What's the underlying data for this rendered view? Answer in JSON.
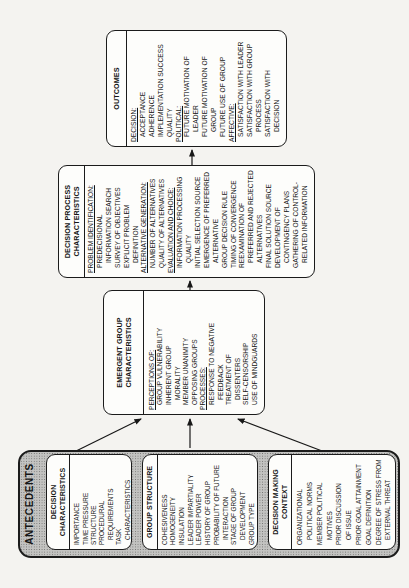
{
  "figure": {
    "antecedents": {
      "title": "ANTECEDENTS",
      "boxes": [
        {
          "title_lines": [
            "DECISION",
            "CHARACTERISTICS"
          ],
          "lines": [
            {
              "text": "IMPORTANCE",
              "indent": 0
            },
            {
              "text": "TIME PRESSURE",
              "indent": 0
            },
            {
              "text": "STRUCTURE",
              "indent": 0
            },
            {
              "text": "PROCEDURAL",
              "indent": 0
            },
            {
              "text": "REQUIREMENTS",
              "indent": 1
            },
            {
              "text": "TASK",
              "indent": 0
            },
            {
              "text": "CHARACTERISTICS",
              "indent": 1
            }
          ]
        },
        {
          "title_lines": [
            "GROUP STRUCTURE"
          ],
          "lines": [
            {
              "text": "COHESIVENESS",
              "indent": 0
            },
            {
              "text": "HOMOGENEITY",
              "indent": 0
            },
            {
              "text": "INSULATION",
              "indent": 0
            },
            {
              "text": "LEADER IMPARTIALITY",
              "indent": 0
            },
            {
              "text": "LEADER POWER",
              "indent": 0
            },
            {
              "text": "HISTORY OF GROUP",
              "indent": 0
            },
            {
              "text": "PROBABILITY OF FUTURE",
              "indent": 0
            },
            {
              "text": "INTERACTION",
              "indent": 1
            },
            {
              "text": "STAGE OF GROUP",
              "indent": 0
            },
            {
              "text": "DEVELOPMENT",
              "indent": 1
            },
            {
              "text": "GROUP TYPE",
              "indent": 0
            }
          ]
        },
        {
          "title_lines": [
            "DECISION MAKING",
            "CONTEXT"
          ],
          "lines": [
            {
              "text": "ORGANIZATIONAL",
              "indent": 0
            },
            {
              "text": "POLITICAL NORMS",
              "indent": 1
            },
            {
              "text": "MEMBER POLITICAL",
              "indent": 0
            },
            {
              "text": "MOTIVES",
              "indent": 1
            },
            {
              "text": "PRIOR DISCUSSION",
              "indent": 0
            },
            {
              "text": "OF ISSUE",
              "indent": 1
            },
            {
              "text": "PRIOR GOAL ATTAINMENT",
              "indent": 0
            },
            {
              "text": "GOAL DEFINITION",
              "indent": 0
            },
            {
              "text": "DEGREE OF STRESS FROM",
              "indent": 0
            },
            {
              "text": "EXTERNAL THREAT",
              "indent": 1
            }
          ]
        }
      ]
    },
    "emergent_group_characteristics": {
      "title_lines": [
        "EMERGENT GROUP",
        "CHARACTERISTICS"
      ],
      "lines": [
        {
          "text": "PERCEPTIONS OF:",
          "indent": 0,
          "underline": true
        },
        {
          "text": "GROUP VULNERABILITY",
          "indent": 1
        },
        {
          "text": "INHERENT GROUP",
          "indent": 1
        },
        {
          "text": "MORALITY",
          "indent": 2
        },
        {
          "text": "MEMBER UNANIMITY",
          "indent": 1
        },
        {
          "text": "OPPOSING GROUPS",
          "indent": 1
        },
        {
          "text": "PROCESSES:",
          "indent": 0,
          "underline": true
        },
        {
          "text": "RESPONSE TO NEGATIVE",
          "indent": 1
        },
        {
          "text": "FEEDBACK",
          "indent": 2
        },
        {
          "text": "TREATMENT OF",
          "indent": 1
        },
        {
          "text": "DISSENTERS",
          "indent": 2
        },
        {
          "text": "SELF-CENSORSHIP",
          "indent": 1
        },
        {
          "text": "USE OF MINDGUARDS",
          "indent": 1
        }
      ]
    },
    "decision_process_characteristics": {
      "title_lines": [
        "DECISION PROCESS",
        "CHARACTERISTICS"
      ],
      "lines": [
        {
          "text": "PROBLEM IDENTIFICATION:",
          "indent": 0,
          "underline": true
        },
        {
          "text": "PREDECISIONAL",
          "indent": 1
        },
        {
          "text": "INFORMATION SEARCH",
          "indent": 2
        },
        {
          "text": "SURVEY OF OBJECTIVES",
          "indent": 1
        },
        {
          "text": "EXPLICIT PROBLEM",
          "indent": 1
        },
        {
          "text": "DEFINITION",
          "indent": 2
        },
        {
          "text": "ALTERNATIVE GENERATION:",
          "indent": 0,
          "underline": true
        },
        {
          "text": "NUMBER OF ALTERNATIVES",
          "indent": 1
        },
        {
          "text": "QUALITY OF ALTERNATIVES",
          "indent": 1
        },
        {
          "text": "EVALUATION AND CHOICE:",
          "indent": 0,
          "underline": true
        },
        {
          "text": "INFORMATION PROCESSING",
          "indent": 1
        },
        {
          "text": "QUALITY",
          "indent": 2
        },
        {
          "text": "INITIAL SELECTION SOURCE",
          "indent": 1
        },
        {
          "text": "EMERGENCE OF PREFERRED",
          "indent": 1
        },
        {
          "text": "ALTERNATIVE",
          "indent": 2
        },
        {
          "text": "GROUP DECISION RULE",
          "indent": 1
        },
        {
          "text": "TIMING OF CONVERGENCE",
          "indent": 1
        },
        {
          "text": "REEXAMINATION OF",
          "indent": 1
        },
        {
          "text": "PREFERRED AND REJECTED",
          "indent": 2
        },
        {
          "text": "ALTERNATIVES",
          "indent": 2
        },
        {
          "text": "FINAL SOLUTION SOURCE",
          "indent": 1
        },
        {
          "text": "DEVELOPMENT OF",
          "indent": 1
        },
        {
          "text": "CONTINGENCY PLANS",
          "indent": 2
        },
        {
          "text": "GATHERING OF CONTROL-",
          "indent": 1
        },
        {
          "text": "RELATED INFORMATION",
          "indent": 2
        }
      ]
    },
    "outcomes": {
      "title_lines": [
        "OUTCOMES"
      ],
      "lines": [
        {
          "text": "DECISION:",
          "indent": 0,
          "underline": true
        },
        {
          "text": "ACCEPTANCE",
          "indent": 1
        },
        {
          "text": "ADHERENCE",
          "indent": 1
        },
        {
          "text": "IMPLEMENTATION SUCCESS",
          "indent": 1
        },
        {
          "text": "QUALITY",
          "indent": 1
        },
        {
          "text": "POLITICAL:",
          "indent": 0,
          "underline": true
        },
        {
          "text": "FUTURE MOTIVATION OF",
          "indent": 1
        },
        {
          "text": "LEADER",
          "indent": 2
        },
        {
          "text": "FUTURE MOTIVATION OF",
          "indent": 1
        },
        {
          "text": "GROUP",
          "indent": 2
        },
        {
          "text": "FUTURE USE OF GROUP",
          "indent": 1
        },
        {
          "text": "AFFECTIVE:",
          "indent": 0,
          "underline": true
        },
        {
          "text": "SATISFACTION WITH LEADER",
          "indent": 1
        },
        {
          "text": "SATISFACTION WITH GROUP",
          "indent": 1
        },
        {
          "text": "PROCESS",
          "indent": 2
        },
        {
          "text": "SATISFACTION WITH",
          "indent": 1
        },
        {
          "text": "DECISION",
          "indent": 2
        }
      ]
    }
  },
  "colors": {
    "page_bg": "#f4f3f0",
    "box_fill": "#fdfdfb",
    "box_border": "#1b1b1b",
    "antecedents_fill": "#c3c3c1",
    "line": "#181818",
    "text": "#161616"
  }
}
